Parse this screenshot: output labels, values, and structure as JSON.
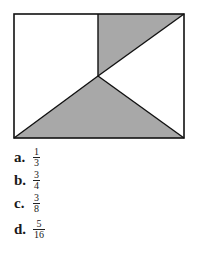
{
  "figure": {
    "shade_color": "#a8a8a8",
    "line_color": "#111111"
  },
  "choices": [
    {
      "letter": "a.",
      "numerator": "1",
      "denominator": "3"
    },
    {
      "letter": "b.",
      "numerator": "3",
      "denominator": "4"
    },
    {
      "letter": "c.",
      "numerator": "3",
      "denominator": "8"
    },
    {
      "letter": "d.",
      "numerator": "5",
      "denominator": "16"
    }
  ]
}
